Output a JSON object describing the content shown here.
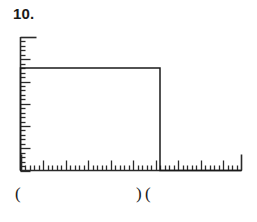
{
  "problem": {
    "number_label": "10."
  },
  "labels": {
    "origin_paren": "(",
    "pulse_end_close_paren": ")",
    "pulse_end_open_paren": "("
  },
  "colors": {
    "ink": "#1a1a1a",
    "axis": "#2a2a2a",
    "background": "#ffffff"
  },
  "chart_data": {
    "type": "line",
    "title": "10.",
    "xlabel": "",
    "ylabel": "",
    "x": [
      0,
      0,
      31,
      31,
      49
    ],
    "values": [
      0,
      23,
      23,
      0,
      0
    ],
    "series": [
      {
        "name": "rectangular-pulse",
        "x": [
          0,
          0,
          31,
          31,
          49
        ],
        "values": [
          0,
          23,
          23,
          0,
          0
        ]
      }
    ],
    "xlim": [
      0,
      49
    ],
    "ylim": [
      0,
      30
    ],
    "grid": false,
    "legend": null,
    "x_axis": {
      "total_minor_ticks": 49,
      "minor_tick_spacing": 1,
      "major_tick_every": 5,
      "tick_labels": [],
      "minor_tick_length_px": 5,
      "major_tick_length_px": 10,
      "end_tick_length_px": 16
    },
    "y_axis": {
      "total_minor_ticks": 30,
      "minor_tick_spacing": 1,
      "major_tick_every": 5,
      "tick_labels": [],
      "minor_tick_length_px": 5,
      "major_tick_length_px": 10,
      "top_tick_length_px": 16
    },
    "annotations": [
      {
        "text": "(",
        "x": 0,
        "position": "below-axis"
      },
      {
        "text": ")",
        "x": 31,
        "position": "below-axis"
      },
      {
        "text": "(",
        "x": 32,
        "position": "below-axis"
      }
    ]
  }
}
